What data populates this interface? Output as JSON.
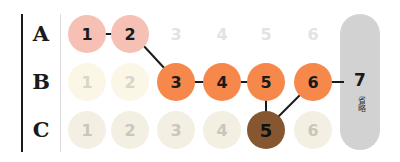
{
  "rows": [
    {
      "label": "A",
      "cells": [
        "1",
        "2",
        "3",
        "4",
        "5",
        "6"
      ],
      "active": [
        true,
        true,
        false,
        false,
        false,
        false
      ]
    },
    {
      "label": "B",
      "cells": [
        "1",
        "2",
        "3",
        "4",
        "5",
        "6"
      ],
      "active": [
        false,
        false,
        true,
        true,
        true,
        true
      ]
    },
    {
      "label": "C",
      "cells": [
        "1",
        "2",
        "3",
        "4",
        "5",
        "6"
      ],
      "active": [
        false,
        false,
        false,
        false,
        true,
        false
      ]
    }
  ],
  "terminal": {
    "number": "7",
    "note": "省略"
  },
  "colors": {
    "row_a_active": "#f6c1b4",
    "row_b_active": "#f5884a",
    "row_c_active": "#85562f",
    "pill": "#d2d2d2"
  },
  "path": [
    "A1",
    "A2",
    "B3",
    "B4",
    "B5",
    "C5",
    "B6",
    "B7"
  ]
}
